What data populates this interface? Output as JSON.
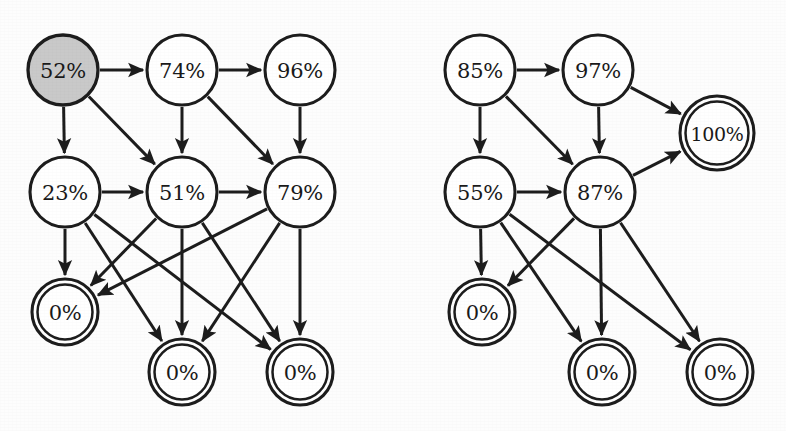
{
  "figure": {
    "background_color": "#fdfdfd",
    "stroke_color": "#1d1d1d",
    "start_node_fill": "#c9c9c9",
    "node_fill": "#ffffff"
  },
  "graphs": [
    {
      "id": "left-graph",
      "name": "left-graph",
      "nodes": [
        {
          "id": "L1",
          "label": "52%",
          "x": 63,
          "y": 70,
          "r": 35,
          "type": "start",
          "shape": "single-circle"
        },
        {
          "id": "L2",
          "label": "74%",
          "x": 182,
          "y": 70,
          "r": 35,
          "type": "normal",
          "shape": "single-circle"
        },
        {
          "id": "L3",
          "label": "96%",
          "x": 300,
          "y": 70,
          "r": 35,
          "type": "normal",
          "shape": "single-circle"
        },
        {
          "id": "L4",
          "label": "23%",
          "x": 65,
          "y": 192,
          "r": 35,
          "type": "normal",
          "shape": "single-circle"
        },
        {
          "id": "L5",
          "label": "51%",
          "x": 182,
          "y": 192,
          "r": 35,
          "type": "normal",
          "shape": "single-circle"
        },
        {
          "id": "L6",
          "label": "79%",
          "x": 300,
          "y": 192,
          "r": 35,
          "type": "normal",
          "shape": "single-circle"
        },
        {
          "id": "L7",
          "label": "0%",
          "x": 65,
          "y": 312,
          "r": 33,
          "type": "accepting",
          "shape": "double-circle"
        },
        {
          "id": "L8",
          "label": "0%",
          "x": 182,
          "y": 372,
          "r": 33,
          "type": "accepting",
          "shape": "double-circle"
        },
        {
          "id": "L9",
          "label": "0%",
          "x": 300,
          "y": 372,
          "r": 33,
          "type": "accepting",
          "shape": "double-circle"
        }
      ],
      "edges": [
        {
          "from": "L1",
          "to": "L2"
        },
        {
          "from": "L2",
          "to": "L3"
        },
        {
          "from": "L1",
          "to": "L4"
        },
        {
          "from": "L1",
          "to": "L5"
        },
        {
          "from": "L2",
          "to": "L5"
        },
        {
          "from": "L2",
          "to": "L6"
        },
        {
          "from": "L3",
          "to": "L6"
        },
        {
          "from": "L4",
          "to": "L5"
        },
        {
          "from": "L5",
          "to": "L6"
        },
        {
          "from": "L4",
          "to": "L7"
        },
        {
          "from": "L4",
          "to": "L8"
        },
        {
          "from": "L4",
          "to": "L9"
        },
        {
          "from": "L5",
          "to": "L7"
        },
        {
          "from": "L5",
          "to": "L8"
        },
        {
          "from": "L5",
          "to": "L9"
        },
        {
          "from": "L6",
          "to": "L7"
        },
        {
          "from": "L6",
          "to": "L8"
        },
        {
          "from": "L6",
          "to": "L9"
        }
      ]
    },
    {
      "id": "right-graph",
      "name": "right-graph",
      "nodes": [
        {
          "id": "R1",
          "label": "85%",
          "x": 480,
          "y": 70,
          "r": 35,
          "type": "normal",
          "shape": "single-circle"
        },
        {
          "id": "R2",
          "label": "97%",
          "x": 598,
          "y": 70,
          "r": 35,
          "type": "normal",
          "shape": "single-circle"
        },
        {
          "id": "R3",
          "label": "100%",
          "x": 717,
          "y": 133,
          "r": 37,
          "type": "accepting",
          "shape": "double-circle"
        },
        {
          "id": "R4",
          "label": "55%",
          "x": 480,
          "y": 192,
          "r": 35,
          "type": "normal",
          "shape": "single-circle"
        },
        {
          "id": "R5",
          "label": "87%",
          "x": 600,
          "y": 192,
          "r": 35,
          "type": "normal",
          "shape": "single-circle"
        },
        {
          "id": "R6",
          "label": "0%",
          "x": 482,
          "y": 312,
          "r": 33,
          "type": "accepting",
          "shape": "double-circle"
        },
        {
          "id": "R7",
          "label": "0%",
          "x": 602,
          "y": 372,
          "r": 33,
          "type": "accepting",
          "shape": "double-circle"
        },
        {
          "id": "R8",
          "label": "0%",
          "x": 720,
          "y": 372,
          "r": 33,
          "type": "accepting",
          "shape": "double-circle"
        }
      ],
      "edges": [
        {
          "from": "R1",
          "to": "R2"
        },
        {
          "from": "R2",
          "to": "R3"
        },
        {
          "from": "R1",
          "to": "R4"
        },
        {
          "from": "R1",
          "to": "R5"
        },
        {
          "from": "R2",
          "to": "R5"
        },
        {
          "from": "R4",
          "to": "R5"
        },
        {
          "from": "R5",
          "to": "R3"
        },
        {
          "from": "R4",
          "to": "R6"
        },
        {
          "from": "R4",
          "to": "R7"
        },
        {
          "from": "R5",
          "to": "R6"
        },
        {
          "from": "R5",
          "to": "R7"
        },
        {
          "from": "R5",
          "to": "R8"
        },
        {
          "from": "R4",
          "to": "R8"
        }
      ]
    }
  ]
}
